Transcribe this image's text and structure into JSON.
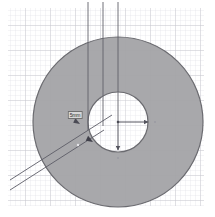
{
  "document": {
    "title": "Annulus Dimension Sketch",
    "background_color": "#ffffff",
    "paper_color": "#fdfdfd"
  },
  "grid": {
    "name": "graph-paper-grid",
    "minor_spacing_px": 5,
    "major_every": 5,
    "minor_color": "#e2e2e4",
    "major_color": "#c9c9cf",
    "area": {
      "x": 8,
      "y": 8,
      "width": 196,
      "height": 198
    }
  },
  "shapes": {
    "outer_disk": {
      "name": "outer-circle",
      "cx": 118,
      "cy": 122,
      "r": 85,
      "fill": "#a3a3a6",
      "stroke": "#6b6b70",
      "stroke_width": 1.2
    },
    "inner_hole": {
      "name": "inner-circle",
      "cx": 118,
      "cy": 122,
      "r": 30,
      "fill": "#ffffff",
      "stroke": "#6b6b70",
      "stroke_width": 1.2
    }
  },
  "annotations": {
    "line_color": "#575760",
    "center_point": {
      "name": "center-point",
      "x": 118,
      "y": 122
    },
    "radius_arrow": {
      "name": "radius-arrow-right",
      "from": {
        "x": 118,
        "y": 122
      },
      "to": {
        "x": 150,
        "y": 122
      }
    },
    "down_arrow": {
      "name": "dimension-arrow-down",
      "from": {
        "x": 118,
        "y": 122
      },
      "to": {
        "x": 118,
        "y": 152
      }
    },
    "vertical_construction_lines": [
      {
        "name": "construction-line-1",
        "x": 88,
        "y1": 2,
        "y2": 130
      },
      {
        "name": "construction-line-2",
        "x": 103,
        "y1": 2,
        "y2": 126
      },
      {
        "name": "construction-line-3",
        "x": 118,
        "y1": 2,
        "y2": 122
      }
    ],
    "diagonal_lines": [
      {
        "name": "diagonal-line-upper",
        "x1": 10,
        "y1": 180,
        "x2": 112,
        "y2": 115
      },
      {
        "name": "diagonal-line-lower",
        "x1": 10,
        "y1": 190,
        "x2": 104,
        "y2": 130
      }
    ],
    "leader_arrowheads": [
      {
        "name": "leader-arrowhead-upper",
        "x": 80,
        "y": 124,
        "angle_deg": 212
      },
      {
        "name": "leader-arrowhead-lower",
        "x": 92,
        "y": 142,
        "angle_deg": 212
      }
    ],
    "tick_marks": [
      {
        "name": "tick-right-of-radius-arrow",
        "x": 155,
        "y": 122
      },
      {
        "name": "tick-below-down-arrow",
        "x": 118,
        "y": 158
      },
      {
        "name": "tick-on-diagonal",
        "x": 78,
        "y": 145
      }
    ]
  },
  "labels": {
    "dimension_label": {
      "name": "dimension-label",
      "text": "5mm",
      "x": 75,
      "y": 115,
      "background": "#d8d8d8",
      "border": "#707070"
    }
  }
}
